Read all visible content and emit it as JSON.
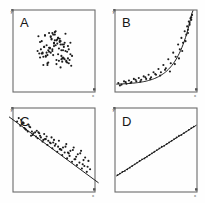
{
  "figure": {
    "background_color": "#fefefe",
    "axis_color": "#6b6b6b",
    "point_color": "#1c1c1c",
    "line_color": "#1f1f1f",
    "layout": "2x2 grid of scatterplot panels",
    "axis_labels": {
      "x": "x",
      "y": "y"
    }
  },
  "chart_data": [
    {
      "type": "scatter",
      "panel": "A",
      "title": "A",
      "xlabel": "x",
      "ylabel": "y",
      "grid": false,
      "legend": "none",
      "xlim": [
        0,
        100
      ],
      "ylim": [
        0,
        100
      ],
      "relationship": "no correlation",
      "fit_line": false,
      "x": [
        46,
        57,
        62,
        38,
        51,
        68,
        42,
        55,
        35,
        60,
        72,
        48,
        30,
        65,
        53,
        44,
        58,
        39,
        70,
        50,
        33,
        61,
        47,
        56,
        41,
        66,
        52,
        37,
        63,
        49,
        31,
        59,
        45,
        54,
        43,
        67,
        36,
        64,
        40,
        57,
        34,
        69,
        46,
        53,
        62,
        48,
        58,
        42,
        51,
        60,
        38,
        55,
        65,
        44,
        50,
        32,
        71,
        47,
        56,
        61,
        39,
        52,
        66,
        43,
        59,
        35,
        49,
        63,
        45,
        54,
        68,
        41,
        57,
        37,
        50,
        60,
        46,
        64,
        33,
        55,
        42,
        58,
        48,
        67,
        51,
        36,
        62,
        44,
        53,
        70,
        40,
        59
      ],
      "y": [
        48,
        62,
        41,
        55,
        70,
        52,
        35,
        66,
        47,
        58,
        44,
        72,
        50,
        37,
        63,
        54,
        30,
        69,
        46,
        59,
        42,
        51,
        65,
        38,
        57,
        49,
        74,
        33,
        60,
        45,
        68,
        40,
        53,
        64,
        36,
        56,
        48,
        71,
        43,
        61,
        52,
        39,
        67,
        34,
        58,
        50,
        62,
        45,
        73,
        41,
        55,
        66,
        38,
        49,
        60,
        47,
        32,
        64,
        53,
        42,
        69,
        57,
        36,
        51,
        44,
        62,
        70,
        40,
        54,
        59,
        35,
        48,
        65,
        43,
        56,
        37,
        68,
        50,
        61,
        46,
        33,
        58,
        52,
        41,
        63,
        47,
        55,
        72,
        39,
        60,
        44,
        51
      ]
    },
    {
      "type": "scatter",
      "panel": "B",
      "title": "B",
      "xlabel": "x",
      "ylabel": "y",
      "grid": false,
      "legend": "none",
      "xlim": [
        0,
        100
      ],
      "ylim": [
        0,
        100
      ],
      "relationship": "strong nonlinear (exponential) positive",
      "fit_line": true,
      "fit_type": "exponential",
      "x": [
        4,
        8,
        11,
        14,
        17,
        20,
        23,
        26,
        29,
        32,
        35,
        38,
        41,
        44,
        47,
        50,
        53,
        56,
        59,
        62,
        65,
        68,
        71,
        74,
        77,
        79,
        81,
        83,
        85,
        87,
        88,
        89,
        90,
        91,
        92,
        93,
        94,
        6,
        13,
        19,
        25,
        31,
        37,
        43,
        49,
        55,
        61,
        67,
        73,
        78,
        82,
        86,
        89,
        91,
        93
      ],
      "y": [
        11,
        9,
        13,
        10,
        14,
        12,
        16,
        13,
        17,
        15,
        19,
        16,
        21,
        18,
        24,
        21,
        28,
        24,
        33,
        29,
        40,
        35,
        48,
        43,
        58,
        52,
        66,
        60,
        74,
        70,
        80,
        76,
        86,
        82,
        90,
        88,
        94,
        8,
        12,
        11,
        15,
        13,
        18,
        16,
        22,
        20,
        27,
        25,
        34,
        41,
        50,
        62,
        72,
        84,
        91
      ]
    },
    {
      "type": "scatter",
      "panel": "C",
      "title": "C",
      "xlabel": "x",
      "ylabel": "y",
      "grid": false,
      "legend": "none",
      "xlim": [
        0,
        100
      ],
      "ylim": [
        0,
        100
      ],
      "relationship": "strong negative linear",
      "fit_line": true,
      "fit_type": "linear",
      "fit_slope": -0.72,
      "fit_intercept": 86,
      "x": [
        5,
        9,
        12,
        15,
        18,
        21,
        24,
        27,
        30,
        33,
        36,
        39,
        42,
        45,
        48,
        51,
        54,
        57,
        60,
        63,
        66,
        69,
        72,
        75,
        78,
        81,
        84,
        87,
        90,
        7,
        11,
        16,
        20,
        25,
        29,
        34,
        38,
        43,
        47,
        52,
        56,
        61,
        65,
        70,
        74,
        79,
        83,
        88,
        92,
        10,
        14,
        19,
        23,
        28,
        32,
        37,
        41,
        46,
        50,
        55,
        59,
        64,
        68,
        73,
        77,
        82,
        86,
        91,
        13,
        22,
        31,
        40,
        49,
        58,
        67,
        76,
        85,
        94
      ],
      "y": [
        84,
        79,
        83,
        75,
        72,
        77,
        68,
        71,
        64,
        67,
        60,
        63,
        56,
        59,
        52,
        55,
        48,
        51,
        44,
        47,
        40,
        43,
        36,
        39,
        32,
        35,
        28,
        31,
        24,
        88,
        81,
        74,
        78,
        70,
        73,
        65,
        69,
        61,
        65,
        57,
        61,
        53,
        57,
        49,
        53,
        45,
        49,
        41,
        37,
        86,
        76,
        80,
        72,
        66,
        70,
        62,
        66,
        58,
        62,
        54,
        50,
        54,
        46,
        50,
        42,
        46,
        38,
        30,
        82,
        67,
        71,
        63,
        59,
        51,
        47,
        39,
        33,
        27
      ]
    },
    {
      "type": "scatter",
      "panel": "D",
      "title": "D",
      "xlabel": "x",
      "ylabel": "y",
      "grid": false,
      "legend": "none",
      "xlim": [
        0,
        100
      ],
      "ylim": [
        0,
        100
      ],
      "relationship": "perfect positive linear",
      "fit_line": true,
      "fit_type": "linear",
      "fit_slope": 0.62,
      "fit_intercept": 18,
      "x": [
        3,
        6,
        9,
        12,
        15,
        18,
        21,
        24,
        27,
        30,
        33,
        36,
        39,
        42,
        45,
        48,
        51,
        54,
        57,
        60,
        63,
        66,
        69,
        72,
        75,
        78,
        81,
        84,
        87,
        90,
        93,
        96
      ],
      "y": [
        20,
        22,
        24,
        25,
        27,
        29,
        31,
        33,
        35,
        37,
        39,
        40,
        42,
        44,
        46,
        48,
        50,
        52,
        54,
        55,
        57,
        59,
        61,
        63,
        65,
        67,
        68,
        70,
        72,
        74,
        76,
        78
      ]
    }
  ],
  "panels": [
    {
      "id": "A",
      "label": "A",
      "x_tag": "x",
      "y_tag": "y"
    },
    {
      "id": "B",
      "label": "B",
      "x_tag": "x",
      "y_tag": "y"
    },
    {
      "id": "C",
      "label": "C",
      "x_tag": "x",
      "y_tag": "y"
    },
    {
      "id": "D",
      "label": "D",
      "x_tag": "x",
      "y_tag": "y"
    }
  ]
}
